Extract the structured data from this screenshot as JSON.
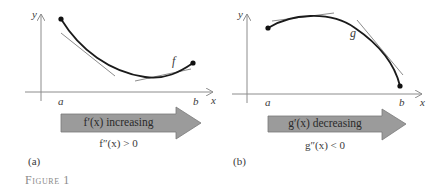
{
  "figure": {
    "caption": "Figure 1",
    "colors": {
      "curve": "#1a1a1a",
      "tangent": "#8c8c8c",
      "axis": "#8c8c8c",
      "arrow_fill": "#9b9b9b",
      "arrow_stroke": "#7a7a7a",
      "caption": "#8a8a8a"
    }
  },
  "panels": [
    {
      "tag": "(a)",
      "function_label": "f",
      "axis_x_label": "x",
      "axis_y_label": "y",
      "left_endpoint_label": "a",
      "right_endpoint_label": "b",
      "arrow_text": "f′(x) increasing",
      "condition": "f″(x) > 0",
      "concavity": "concave up"
    },
    {
      "tag": "(b)",
      "function_label": "g",
      "axis_x_label": "x",
      "axis_y_label": "y",
      "left_endpoint_label": "a",
      "right_endpoint_label": "b",
      "arrow_text": "g′(x) decreasing",
      "condition": "g″(x) < 0",
      "concavity": "concave down"
    }
  ]
}
